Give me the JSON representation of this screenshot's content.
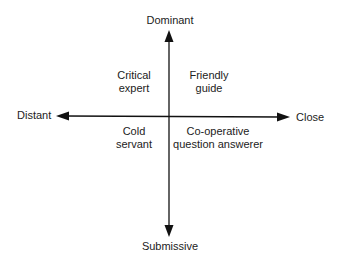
{
  "diagram": {
    "type": "quadrant",
    "axes": {
      "vertical": {
        "top": "Dominant",
        "bottom": "Submissive"
      },
      "horizontal": {
        "left": "Distant",
        "right": "Close"
      }
    },
    "quadrants": {
      "top_left": {
        "line1": "Critical",
        "line2": "expert"
      },
      "top_right": {
        "line1": "Friendly",
        "line2": "guide"
      },
      "bottom_left": {
        "line1": "Cold",
        "line2": "servant"
      },
      "bottom_right": {
        "line1": "Co-operative",
        "line2": "question answerer"
      }
    },
    "colors": {
      "line": "#111111",
      "text": "#222222",
      "background": "#ffffff"
    }
  }
}
